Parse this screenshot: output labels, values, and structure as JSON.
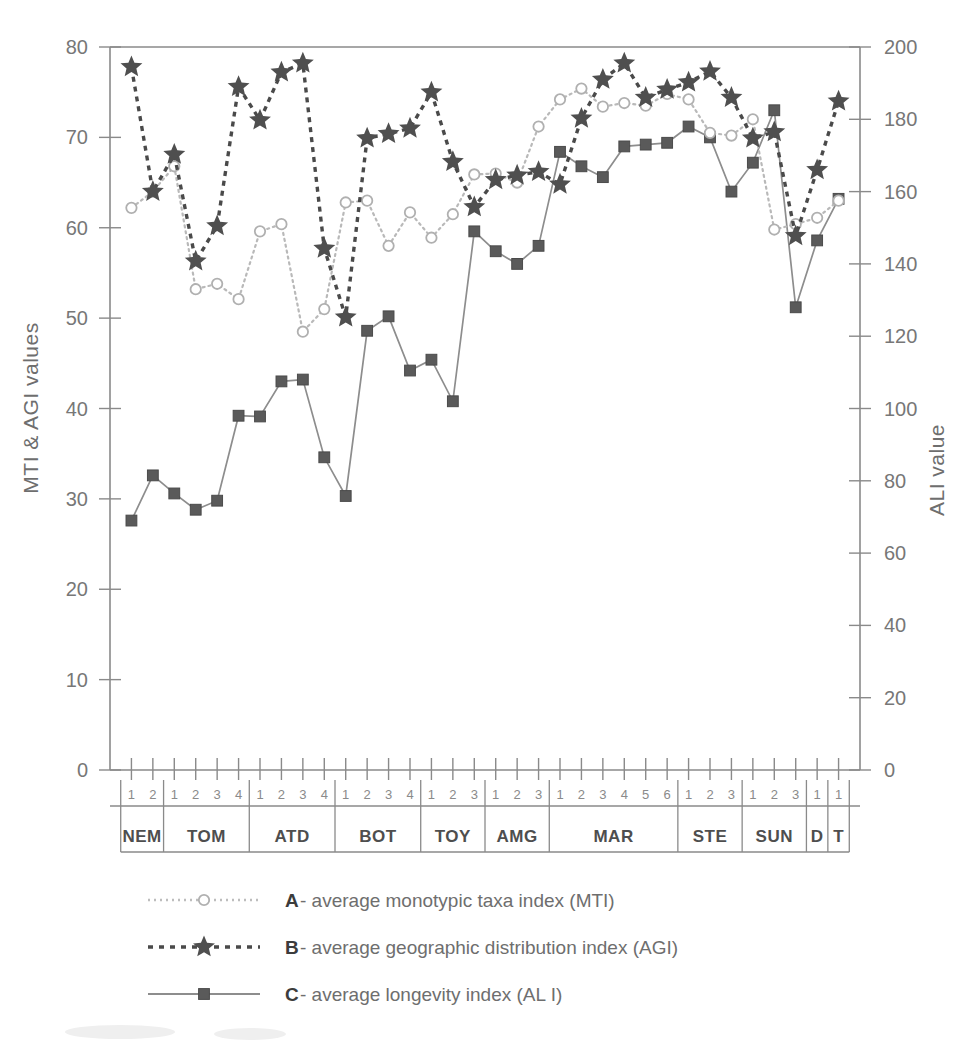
{
  "chart_data": {
    "type": "line",
    "title": "",
    "ylabel": "MTI & AGI values",
    "ylabel_right": "ALI value",
    "xlabel": "",
    "ylim": [
      0,
      80
    ],
    "ylim_right": [
      0,
      200
    ],
    "yticks": [
      0,
      10,
      20,
      30,
      40,
      50,
      60,
      70,
      80
    ],
    "yticks_right": [
      0,
      20,
      40,
      60,
      80,
      100,
      120,
      140,
      160,
      180,
      200
    ],
    "grid": false,
    "legend_position": "below",
    "x_groups": [
      {
        "label": "NEM",
        "subticks": [
          "1",
          "2"
        ]
      },
      {
        "label": "TOM",
        "subticks": [
          "1",
          "2",
          "3",
          "4"
        ]
      },
      {
        "label": "ATD",
        "subticks": [
          "1",
          "2",
          "3",
          "4"
        ]
      },
      {
        "label": "BOT",
        "subticks": [
          "1",
          "2",
          "3",
          "4"
        ]
      },
      {
        "label": "TOY",
        "subticks": [
          "1",
          "2",
          "3"
        ]
      },
      {
        "label": "AMG",
        "subticks": [
          "1",
          "2",
          "3"
        ]
      },
      {
        "label": "MAR",
        "subticks": [
          "1",
          "2",
          "3",
          "4",
          "5",
          "6"
        ]
      },
      {
        "label": "STE",
        "subticks": [
          "1",
          "2",
          "3"
        ]
      },
      {
        "label": "SUN",
        "subticks": [
          "1",
          "2",
          "3"
        ]
      },
      {
        "label": "D",
        "subticks": [
          "1"
        ]
      },
      {
        "label": "T",
        "subticks": [
          "1"
        ]
      }
    ],
    "series": [
      {
        "name": "A- average monotypic taxa index (MTI)",
        "key": "A",
        "short": "MTI",
        "axis": "left",
        "marker": "open-circle",
        "line": "dotted",
        "color": "#b9b9b9",
        "values": [
          62.2,
          64.0,
          66.8,
          53.2,
          53.8,
          52.1,
          59.6,
          60.4,
          48.5,
          51.0,
          62.8,
          63.0,
          58.0,
          61.7,
          58.9,
          61.5,
          65.9,
          66.0,
          65.0,
          71.2,
          74.2,
          75.4,
          73.4,
          73.8,
          73.5,
          74.8,
          74.2,
          70.5,
          70.2,
          72.0,
          59.8,
          60.4,
          61.1,
          63.0
        ]
      },
      {
        "name": "B- average geographic distribution index (AGI)",
        "key": "B",
        "short": "AGI",
        "axis": "left",
        "marker": "star",
        "line": "dashed",
        "color": "#4a4a4a",
        "values": [
          77.8,
          64.0,
          68.1,
          56.3,
          60.2,
          75.6,
          71.9,
          77.2,
          78.2,
          57.7,
          50.1,
          69.9,
          70.4,
          71.0,
          75.0,
          67.3,
          62.3,
          65.3,
          65.8,
          66.2,
          64.8,
          72.1,
          76.4,
          78.2,
          74.4,
          75.3,
          76.1,
          77.3,
          74.4,
          69.9,
          70.6,
          59.1,
          66.4,
          74.0
        ]
      },
      {
        "name": "C- average longevity index (AL I)",
        "key": "C",
        "short": "ALI",
        "axis": "right",
        "marker": "square",
        "line": "solid",
        "color": "#8d8d8d",
        "values": [
          69.0,
          81.5,
          76.5,
          72.0,
          74.5,
          98.0,
          97.8,
          107.5,
          108.0,
          86.5,
          75.8,
          121.5,
          125.5,
          110.5,
          113.5,
          102.0,
          149.0,
          143.5,
          140.0,
          145.0,
          171.0,
          167.0,
          164.0,
          172.5,
          173.0,
          173.5,
          178.0,
          175.0,
          160.0,
          168.0,
          182.5,
          128.0,
          146.5,
          158.0
        ]
      }
    ]
  },
  "legend": {
    "items": [
      {
        "key": "A",
        "label": "- average monotypic taxa index (MTI)",
        "style": "dotted-circle"
      },
      {
        "key": "B",
        "label": "- average geographic distribution index (AGI)",
        "style": "dashed-star"
      },
      {
        "key": "C",
        "label": "- average longevity index (AL I)",
        "style": "solid-square"
      }
    ]
  }
}
